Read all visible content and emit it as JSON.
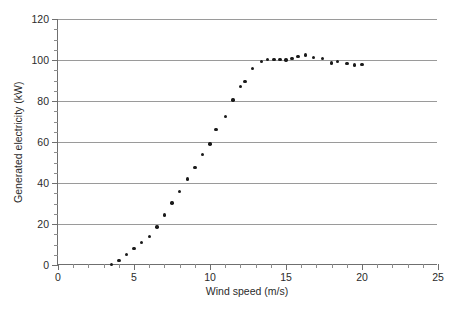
{
  "chart_data": {
    "type": "scatter",
    "title": "",
    "subtitle": "",
    "xlabel": "Wind speed (m/s)",
    "ylabel": "Generated electricity (kW)",
    "xlim": [
      0,
      25
    ],
    "ylim": [
      0,
      120
    ],
    "xticks": [
      0,
      5,
      10,
      15,
      20,
      25
    ],
    "yticks": [
      0,
      20,
      40,
      60,
      80,
      100,
      120
    ],
    "xtick_labels": [
      "0",
      "5",
      "10",
      "15",
      "20",
      "25"
    ],
    "ytick_labels": [
      "0",
      "20",
      "40",
      "60",
      "80",
      "100",
      "120"
    ],
    "x_minor_interval": 1,
    "y_minor_interval": 5,
    "grid": "horizontal",
    "legend": null,
    "marker": "filled-circle",
    "marker_color": "#1a1a1a",
    "grid_color": "#9a9a9a",
    "axis_color": "#6f6f6f",
    "background_color": "#ffffff",
    "series": [
      {
        "name": "Generated electricity",
        "points": [
          [
            3.5,
            0.3
          ],
          [
            4.0,
            2.2
          ],
          [
            4.5,
            5.0
          ],
          [
            5.0,
            8.0
          ],
          [
            5.5,
            11.0
          ],
          [
            6.0,
            14.0
          ],
          [
            6.5,
            18.5
          ],
          [
            7.0,
            24.3
          ],
          [
            7.5,
            30.3
          ],
          [
            8.0,
            36.0
          ],
          [
            8.5,
            42.0
          ],
          [
            9.0,
            47.7
          ],
          [
            9.5,
            54.0
          ],
          [
            10.0,
            59.0
          ],
          [
            10.4,
            66.0
          ],
          [
            11.0,
            72.5
          ],
          [
            11.5,
            80.5
          ],
          [
            12.0,
            87.0
          ],
          [
            12.3,
            89.5
          ],
          [
            12.8,
            96.0
          ],
          [
            13.4,
            99.3
          ],
          [
            13.8,
            100.2
          ],
          [
            14.2,
            100.2
          ],
          [
            14.6,
            100.3
          ],
          [
            15.0,
            100.0
          ],
          [
            15.4,
            100.8
          ],
          [
            15.8,
            101.7
          ],
          [
            16.3,
            102.5
          ],
          [
            16.8,
            101.2
          ],
          [
            17.4,
            100.8
          ],
          [
            18.0,
            98.6
          ],
          [
            18.4,
            99.2
          ],
          [
            19.0,
            98.2
          ],
          [
            19.5,
            97.5
          ],
          [
            20.0,
            97.7
          ]
        ]
      }
    ]
  }
}
